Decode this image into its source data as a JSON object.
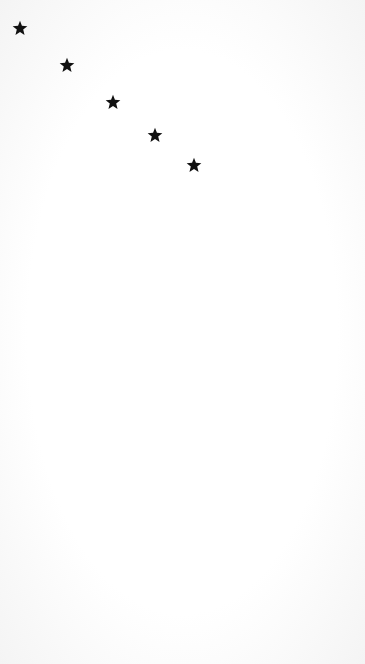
{
  "background_color": "#ffffff",
  "star_color": "#111111",
  "stars": [
    {
      "icon": "star-icon",
      "x": 20,
      "y": 28
    },
    {
      "icon": "star-icon",
      "x": 67,
      "y": 65
    },
    {
      "icon": "star-icon",
      "x": 113,
      "y": 102
    },
    {
      "icon": "star-icon",
      "x": 155,
      "y": 135
    },
    {
      "icon": "star-icon",
      "x": 194,
      "y": 165
    }
  ]
}
